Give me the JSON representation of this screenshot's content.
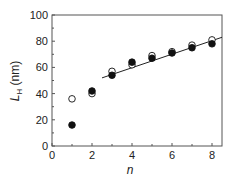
{
  "chart_data": {
    "type": "scatter",
    "title": "",
    "xlabel": "n",
    "ylabel": "L_H (nm)",
    "ylabel_main": "L",
    "ylabel_sub": "H",
    "ylabel_unit": " (nm)",
    "xlim": [
      0,
      8.5
    ],
    "ylim": [
      0,
      100
    ],
    "xticks": [
      0,
      2,
      4,
      6,
      8
    ],
    "yticks": [
      0,
      20,
      40,
      60,
      80,
      100
    ],
    "grid": false,
    "legend": "none",
    "series": [
      {
        "name": "open circles",
        "marker": "open-circle",
        "x": [
          1,
          2,
          3,
          4,
          5,
          6,
          7,
          8
        ],
        "y": [
          36,
          40,
          57,
          62,
          69,
          72,
          77,
          81
        ]
      },
      {
        "name": "filled circles",
        "marker": "filled-circle",
        "x": [
          1,
          2,
          3,
          4,
          5,
          6,
          7,
          8
        ],
        "y": [
          16,
          42,
          54,
          64,
          67,
          71,
          75,
          78
        ]
      }
    ],
    "fit_line": {
      "x": [
        2.5,
        8.5
      ],
      "y": [
        52,
        83
      ]
    }
  }
}
